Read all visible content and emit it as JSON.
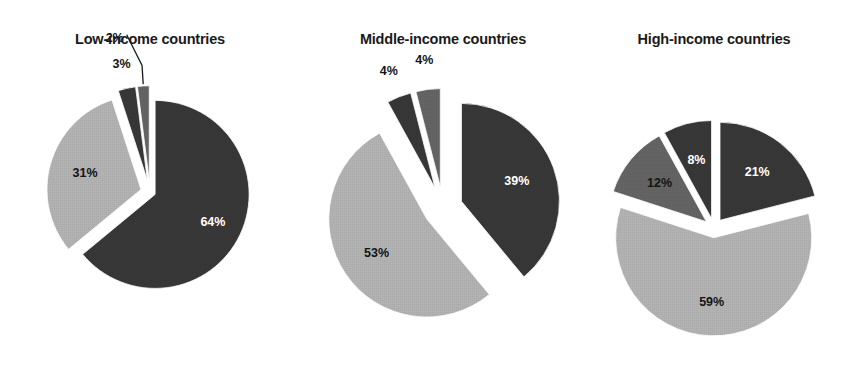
{
  "figure": {
    "background": "#ffffff",
    "width": 855,
    "height": 370
  },
  "palette": {
    "dark": "#2b2b2b",
    "medium": "#5a5a5a",
    "light": "#adadad",
    "label_on_dark": "#ffffff",
    "label_on_light": "#141414",
    "title": "#1a1a1a",
    "wedge_edge": "#ffffff"
  },
  "chart_data": [
    {
      "type": "pie",
      "title": "Low-income countries",
      "exploded": true,
      "center": {
        "x": 150,
        "y": 192
      },
      "radius": 94,
      "start_angle_deg": -90,
      "slices": [
        {
          "label": "64%",
          "value": 64,
          "color": "#2b2b2b",
          "label_color": "#ffffff",
          "explode": 0.06,
          "label_inside": true,
          "label_radius_frac": 0.68
        },
        {
          "label": "31%",
          "value": 31,
          "color": "#adadad",
          "label_color": "#141414",
          "explode": 0.1,
          "label_inside": true,
          "label_radius_frac": 0.62
        },
        {
          "label": "3%",
          "value": 3,
          "color": "#2b2b2b",
          "label_color": "#141414",
          "explode": 0.13,
          "label_inside": false,
          "label_radius_frac": 1.26,
          "leader": false
        },
        {
          "label": "2%",
          "value": 2,
          "color": "#5a5a5a",
          "label_color": "#141414",
          "explode": 0.13,
          "label_inside": false,
          "label_radius_frac": 1.45,
          "label_dx": -26,
          "label_dy": -6,
          "leader": true
        }
      ]
    },
    {
      "type": "pie",
      "title": "Middle-income countries",
      "exploded": true,
      "center": {
        "x": 443,
        "y": 208
      },
      "radius": 98,
      "start_angle_deg": -90,
      "slices": [
        {
          "label": "39%",
          "value": 39,
          "color": "#2b2b2b",
          "label_color": "#ffffff",
          "explode": 0.2,
          "label_inside": true,
          "label_radius_frac": 0.6
        },
        {
          "label": "53%",
          "value": 53,
          "color": "#adadad",
          "label_color": "#141414",
          "explode": 0.2,
          "label_inside": true,
          "label_radius_frac": 0.62
        },
        {
          "label": "4%",
          "value": 4,
          "color": "#2b2b2b",
          "label_color": "#141414",
          "explode": 0.22,
          "label_inside": false,
          "label_radius_frac": 1.28
        },
        {
          "label": "4%",
          "value": 4,
          "color": "#5a5a5a",
          "label_color": "#141414",
          "explode": 0.22,
          "label_inside": false,
          "label_radius_frac": 1.3
        }
      ]
    },
    {
      "type": "pie",
      "title": "High-income countries",
      "exploded": true,
      "center": {
        "x": 714,
        "y": 228
      },
      "radius": 98,
      "start_angle_deg": -90,
      "slices": [
        {
          "label": "21%",
          "value": 21,
          "color": "#2b2b2b",
          "label_color": "#ffffff",
          "explode": 0.1,
          "label_inside": true,
          "label_radius_frac": 0.62
        },
        {
          "label": "59%",
          "value": 59,
          "color": "#adadad",
          "label_color": "#141414",
          "explode": 0.1,
          "label_inside": true,
          "label_radius_frac": 0.66
        },
        {
          "label": "12%",
          "value": 12,
          "color": "#5a5a5a",
          "label_color": "#141414",
          "explode": 0.1,
          "label_inside": true,
          "label_radius_frac": 0.62
        },
        {
          "label": "8%",
          "value": 8,
          "color": "#2b2b2b",
          "label_color": "#ffffff",
          "explode": 0.1,
          "label_inside": true,
          "label_radius_frac": 0.62
        }
      ]
    }
  ],
  "titles": {
    "low": "Low-income countries",
    "middle": "Middle-income countries",
    "high": "High-income countries"
  },
  "title_positions": [
    {
      "x": 150,
      "y": 44
    },
    {
      "x": 443,
      "y": 44
    },
    {
      "x": 714,
      "y": 44
    }
  ]
}
